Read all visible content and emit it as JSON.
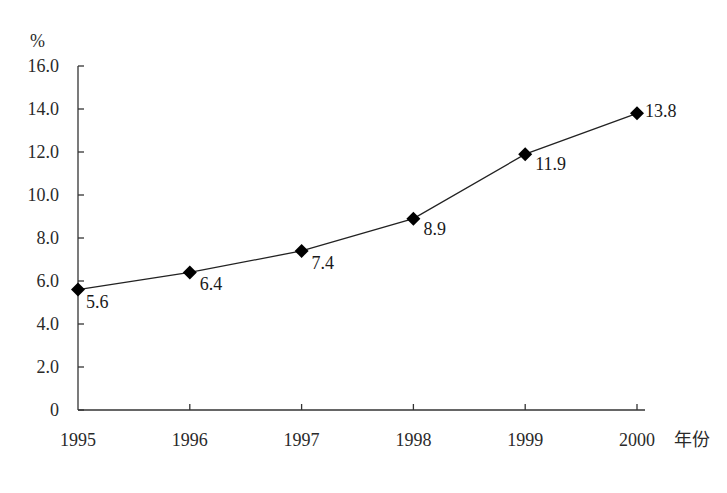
{
  "chart_data": {
    "type": "line",
    "title": "",
    "xlabel": "年份",
    "ylabel": "%",
    "categories": [
      "1995",
      "1996",
      "1997",
      "1998",
      "1999",
      "2000"
    ],
    "series": [
      {
        "name": "",
        "values": [
          5.6,
          6.4,
          7.4,
          8.9,
          11.9,
          13.8
        ]
      }
    ],
    "data_labels": [
      "5.6",
      "6.4",
      "7.4",
      "8.9",
      "11.9",
      "13.8"
    ],
    "ylim": [
      0,
      16
    ],
    "yticks": [
      "0",
      "2.0",
      "4.0",
      "6.0",
      "8.0",
      "10.0",
      "12.0",
      "14.0",
      "16.0"
    ],
    "grid": false,
    "legend": "none",
    "marker": "diamond",
    "colors": {
      "line": "#222222",
      "marker": "#000000",
      "axis": "#333333"
    }
  }
}
